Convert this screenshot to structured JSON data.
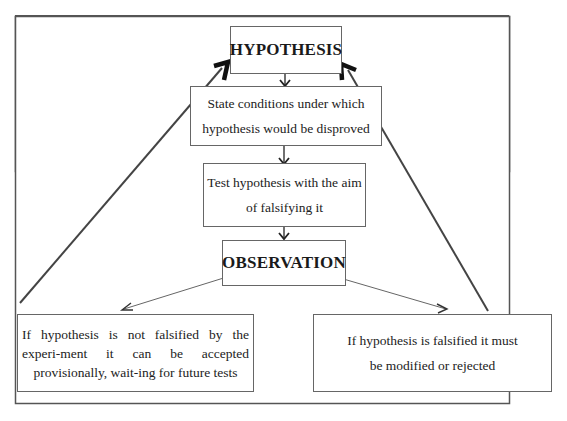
{
  "diagram": {
    "nodes": {
      "hypothesis": {
        "label": "HYPOTHESIS"
      },
      "state_conditions": {
        "line1": "State conditions under which",
        "line2": "hypothesis would be disproved"
      },
      "test_hypothesis": {
        "line1": "Test hypothesis with the aim",
        "line2": "of falsifying it"
      },
      "observation": {
        "label": "OBSERVATION"
      },
      "not_falsified": {
        "text": "If hypothesis is not falsified by the experi-ment it can be accepted provisionally, wait-ing for future tests"
      },
      "falsified": {
        "line1": "If hypothesis is falsified it must",
        "line2": "be modified or rejected"
      }
    },
    "edges": [
      {
        "from": "hypothesis",
        "to": "state_conditions",
        "style": "thin-arrow"
      },
      {
        "from": "state_conditions",
        "to": "test_hypothesis",
        "style": "thin-arrow"
      },
      {
        "from": "test_hypothesis",
        "to": "observation",
        "style": "thin-arrow"
      },
      {
        "from": "observation",
        "to": "not_falsified",
        "style": "thin-arrow"
      },
      {
        "from": "observation",
        "to": "falsified",
        "style": "thin-arrow"
      },
      {
        "from": "not_falsified",
        "to": "hypothesis",
        "style": "bold-arrow"
      },
      {
        "from": "falsified",
        "to": "hypothesis",
        "style": "bold-arrow"
      }
    ],
    "colors": {
      "line": "#555555",
      "text": "#222222",
      "border": "#666666"
    }
  }
}
